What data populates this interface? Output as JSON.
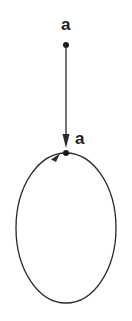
{
  "diagram": {
    "type": "state-diagram",
    "nodes": [
      {
        "id": "top",
        "label": "a",
        "x": 66,
        "y": 45
      },
      {
        "id": "bottom",
        "label": "a",
        "x": 66,
        "y": 153
      }
    ],
    "edges": [
      {
        "from": "top",
        "to": "bottom",
        "kind": "straight-arrow"
      },
      {
        "from": "bottom",
        "to": "bottom",
        "kind": "self-loop-ellipse"
      }
    ],
    "colors": {
      "stroke": "#2a2a2a",
      "background": "#ffffff"
    }
  }
}
